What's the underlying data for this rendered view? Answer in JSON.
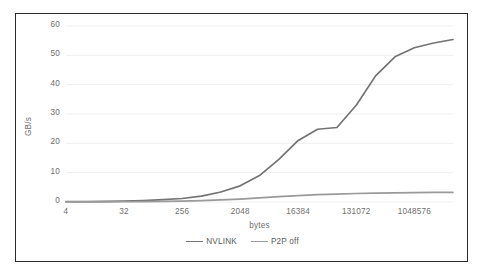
{
  "chart_data": {
    "type": "line",
    "title": "",
    "xlabel": "bytes",
    "ylabel": "GB/s",
    "xscale": "log2",
    "grid": true,
    "legend_position": "bottom",
    "ylim": [
      0,
      60
    ],
    "yticks": [
      0,
      10,
      20,
      30,
      40,
      50,
      60
    ],
    "xticks": [
      4,
      32,
      256,
      2048,
      16384,
      131072,
      1048576
    ],
    "xtick_labels": [
      "4",
      "32",
      "256",
      "2048",
      "16384",
      "131072",
      "1048576"
    ],
    "ytick_labels": [
      "0",
      "10",
      "20",
      "30",
      "40",
      "50",
      "60"
    ],
    "x": [
      4,
      8,
      16,
      32,
      64,
      128,
      256,
      512,
      1024,
      2048,
      4096,
      8192,
      16384,
      32768,
      65536,
      131072,
      262144,
      524288,
      1048576,
      2097152,
      4194304
    ],
    "series": [
      {
        "name": "NVLINK",
        "color": "#737373",
        "values": [
          0.1,
          0.15,
          0.2,
          0.3,
          0.5,
          0.8,
          1.2,
          2.0,
          3.4,
          5.5,
          9.0,
          14.5,
          21.0,
          24.8,
          25.4,
          33.0,
          43.0,
          49.5,
          52.6,
          54.2,
          55.4
        ]
      },
      {
        "name": "P2P off",
        "color": "#9a9a9a",
        "values": [
          0.02,
          0.03,
          0.05,
          0.08,
          0.12,
          0.2,
          0.3,
          0.45,
          0.7,
          1.0,
          1.4,
          1.8,
          2.2,
          2.5,
          2.7,
          2.9,
          3.0,
          3.1,
          3.2,
          3.25,
          3.3
        ]
      }
    ]
  },
  "legend": {
    "items": [
      {
        "label": "NVLINK",
        "color": "#737373"
      },
      {
        "label": "P2P off",
        "color": "#9a9a9a"
      }
    ]
  },
  "axes": {
    "y_title": "GB/s",
    "x_title": "bytes"
  },
  "colors": {
    "frame": "#2b2b2b",
    "gridline": "#eceff3",
    "tick_text": "#6e6e6e",
    "plot_background": "#ffffff"
  }
}
